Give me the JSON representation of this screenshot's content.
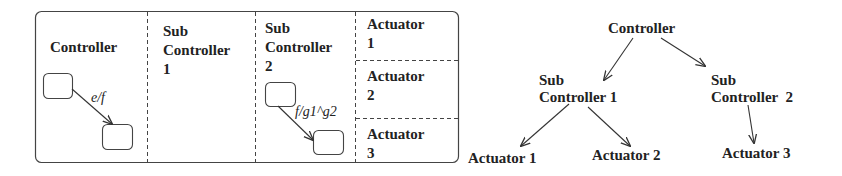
{
  "statechart": {
    "regions": [
      {
        "name": "Controller",
        "label": "Controller"
      },
      {
        "name": "Sub Controller 1",
        "label": "Sub\nController\n1"
      },
      {
        "name": "Sub Controller 2",
        "label": "Sub\nController\n2"
      },
      {
        "name": "Actuator 1",
        "label": "Actuator\n1"
      },
      {
        "name": "Actuator 2",
        "label": "Actuator\n2"
      },
      {
        "name": "Actuator 3",
        "label": "Actuator\n3"
      }
    ],
    "transitions": [
      {
        "region": "Controller",
        "label": "e/f"
      },
      {
        "region": "Sub Controller 2",
        "label": "f/g1^g2"
      }
    ]
  },
  "tree": {
    "root": "Controller",
    "level1": [
      "Sub\nController 1",
      "Sub\nController  2"
    ],
    "leaves": [
      "Actuator 1",
      "Actuator 2",
      "Actuator 3"
    ],
    "edges": [
      [
        "Controller",
        "Sub Controller 1"
      ],
      [
        "Controller",
        "Sub Controller 2"
      ],
      [
        "Sub Controller 1",
        "Actuator 1"
      ],
      [
        "Sub Controller 1",
        "Actuator 2"
      ],
      [
        "Sub Controller 2",
        "Actuator 3"
      ]
    ]
  },
  "colors": {
    "stroke": "#333333",
    "background": "#ffffff"
  }
}
